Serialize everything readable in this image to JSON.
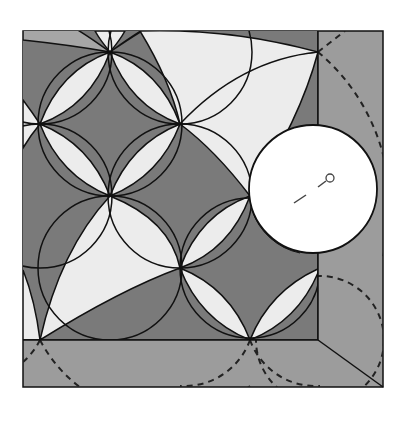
{
  "diagram": {
    "type": "quilt-pattern-illustration",
    "colors": {
      "background": "#ffffff",
      "dark_fill": "#7a7a7a",
      "medium_fill": "#a6a6a6",
      "light_fill": "#ececec",
      "border_fill": "#9c9c9c",
      "outline": "#111111",
      "template_fill": "#ffffff"
    },
    "elements": {
      "outer_frame": "border",
      "inner_block": "curved petal tiling",
      "dashed_arcs": "quilting lines in border",
      "circle_template": "round marking template",
      "pin_marker": "pin-icon"
    }
  }
}
